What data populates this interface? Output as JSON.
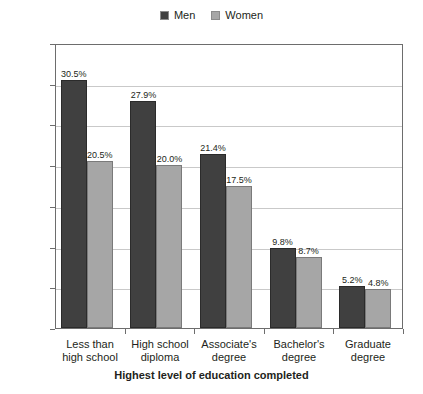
{
  "chart_data": {
    "type": "bar",
    "title": "",
    "xlabel": "Highest level of education completed",
    "ylabel": "",
    "categories": [
      "Less than\nhigh school",
      "High school\ndiploma",
      "Associate's\ndegree",
      "Bachelor's\ndegree",
      "Graduate\ndegree"
    ],
    "category_lines": [
      [
        "Less than",
        "high school"
      ],
      [
        "High school",
        "diploma"
      ],
      [
        "Associate's",
        "degree"
      ],
      [
        "Bachelor's",
        "degree"
      ],
      [
        "Graduate",
        "degree"
      ]
    ],
    "series": [
      {
        "name": "Men",
        "color": "#404040",
        "values": [
          30.5,
          27.9,
          21.4,
          9.8,
          5.2
        ],
        "labels": [
          "30.5%",
          "27.9%",
          "21.4%",
          "9.8%",
          "5.2%"
        ]
      },
      {
        "name": "Women",
        "color": "#a6a6a6",
        "values": [
          20.5,
          20.0,
          17.5,
          8.7,
          4.8
        ],
        "labels": [
          "20.5%",
          "20.0%",
          "17.5%",
          "8.7%",
          "4.8%"
        ]
      }
    ],
    "ylim": [
      0,
      35
    ],
    "ytick_values": [
      0,
      5,
      10,
      15,
      20,
      25,
      30,
      35
    ],
    "ytick_labels": [
      "0.0%",
      "5.0%",
      "10.0%",
      "15.0%",
      "20.0%",
      "25.0%",
      "30.0%",
      "35.0%"
    ],
    "grid": true,
    "legend_position": "top-center",
    "units": "percent"
  },
  "legend": {
    "entries": [
      {
        "label": "Men",
        "color": "#404040"
      },
      {
        "label": "Women",
        "color": "#a6a6a6"
      }
    ]
  },
  "axis_title": {
    "text": "Highest level of education completed"
  }
}
